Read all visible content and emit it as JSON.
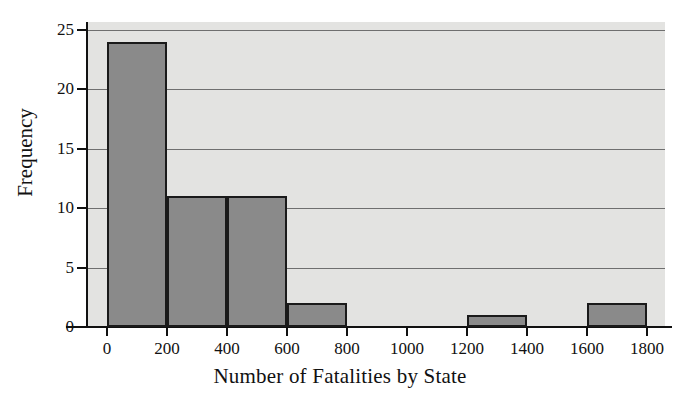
{
  "chart_data": {
    "type": "bar",
    "title": "",
    "xlabel": "Number of Fatalities by State",
    "ylabel": "Frequency",
    "bin_width": 200,
    "bin_edges": [
      0,
      200,
      400,
      600,
      800,
      1000,
      1200,
      1400,
      1600,
      1800
    ],
    "categories": [
      "0-200",
      "200-400",
      "400-600",
      "600-800",
      "800-1000",
      "1000-1200",
      "1200-1400",
      "1400-1600",
      "1600-1800"
    ],
    "values": [
      24,
      11,
      11,
      2,
      0,
      0,
      1,
      0,
      2
    ],
    "xlim": [
      0,
      1800
    ],
    "ylim": [
      0,
      25
    ],
    "xticks": [
      0,
      200,
      400,
      600,
      800,
      1000,
      1200,
      1400,
      1600,
      1800
    ],
    "xtick_labels": [
      "0",
      "200",
      "400",
      "600",
      "800",
      "1000",
      "1200",
      "1400",
      "1600",
      "1800"
    ],
    "yticks": [
      0,
      5,
      10,
      15,
      20,
      25
    ],
    "ytick_labels": [
      "0",
      "5",
      "10",
      "15",
      "20",
      "25"
    ],
    "grid": "horizontal",
    "legend": "none",
    "colors": {
      "bar_fill": "#8a8a8a",
      "bar_edge": "#1a1a1a",
      "plot_background": "#e3e3e1",
      "gridline": "#6f6f6f",
      "axis": "#111111",
      "text": "#111111"
    }
  }
}
